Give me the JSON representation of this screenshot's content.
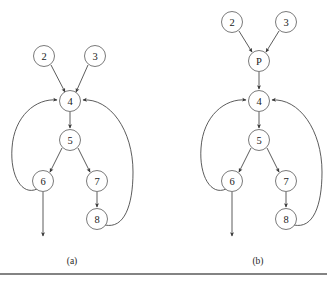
{
  "figure": {
    "type": "flow-graph-pair",
    "background_color": "#ffffff",
    "node_stroke_color": "#6b6b6b",
    "edge_color": "#4a4a4a",
    "text_color": "#1a1a1a",
    "footer_rule_color": "#5a5a5a",
    "node_radius": 10.5,
    "panels": [
      {
        "id": "panel-a",
        "caption": "(a)",
        "caption_pos": {
          "x": 72,
          "y": 264
        },
        "nodes": [
          {
            "id": "n2",
            "label": "2",
            "x": 44,
            "y": 56
          },
          {
            "id": "n3",
            "label": "3",
            "x": 95,
            "y": 56
          },
          {
            "id": "n4",
            "label": "4",
            "x": 70,
            "y": 101
          },
          {
            "id": "n5",
            "label": "5",
            "x": 70,
            "y": 140
          },
          {
            "id": "n6",
            "label": "6",
            "x": 43,
            "y": 181
          },
          {
            "id": "n7",
            "label": "7",
            "x": 97,
            "y": 181
          },
          {
            "id": "n8",
            "label": "8",
            "x": 97,
            "y": 219
          }
        ],
        "edges": [
          {
            "from": "n2",
            "to": "n4",
            "path": "M 51 65 L 65 92",
            "arrow": true
          },
          {
            "from": "n3",
            "to": "n4",
            "path": "M 88 65 L 76 92",
            "arrow": true
          },
          {
            "from": "n4",
            "to": "n5",
            "path": "M 70 112 L 70 128",
            "arrow": true
          },
          {
            "from": "n5",
            "to": "n6",
            "path": "M 62 148 L 50 172",
            "arrow": true
          },
          {
            "from": "n5",
            "to": "n7",
            "path": "M 78 148 L 90 172",
            "arrow": true
          },
          {
            "from": "n7",
            "to": "n8",
            "path": "M 97 192 L 97 207",
            "arrow": true
          },
          {
            "from": "n6",
            "to": "n4",
            "path": "M 37 189 C 22 196 10 176 12 148 C 14 116 36 98 57 100",
            "arrow": true,
            "kind": "back-edge-left"
          },
          {
            "from": "n8",
            "to": "n4",
            "path": "M 105 225 C 124 229 133 206 133 172 C 133 130 110 98 83 100",
            "arrow": true,
            "kind": "back-edge-right"
          },
          {
            "from": "n6",
            "to": "exit-a",
            "path": "M 43 192 L 43 236",
            "arrow": true,
            "kind": "exit"
          }
        ]
      },
      {
        "id": "panel-b",
        "caption": "(b)",
        "caption_pos": {
          "x": 258,
          "y": 264
        },
        "nodes": [
          {
            "id": "n2",
            "label": "2",
            "x": 232,
            "y": 22
          },
          {
            "id": "n3",
            "label": "3",
            "x": 286,
            "y": 22
          },
          {
            "id": "nP",
            "label": "P",
            "x": 259,
            "y": 61
          },
          {
            "id": "n4",
            "label": "4",
            "x": 259,
            "y": 101
          },
          {
            "id": "n5",
            "label": "5",
            "x": 259,
            "y": 140
          },
          {
            "id": "n6",
            "label": "6",
            "x": 232,
            "y": 181
          },
          {
            "id": "n7",
            "label": "7",
            "x": 286,
            "y": 181
          },
          {
            "id": "n8",
            "label": "8",
            "x": 286,
            "y": 219
          }
        ],
        "edges": [
          {
            "from": "n2",
            "to": "nP",
            "path": "M 239 31 L 252 52",
            "arrow": true
          },
          {
            "from": "n3",
            "to": "nP",
            "path": "M 279 31 L 266 52",
            "arrow": true
          },
          {
            "from": "nP",
            "to": "n4",
            "path": "M 259 72 L 259 89",
            "arrow": true
          },
          {
            "from": "n4",
            "to": "n5",
            "path": "M 259 112 L 259 128",
            "arrow": true
          },
          {
            "from": "n5",
            "to": "n6",
            "path": "M 251 148 L 239 172",
            "arrow": true
          },
          {
            "from": "n5",
            "to": "n7",
            "path": "M 267 148 L 279 172",
            "arrow": true
          },
          {
            "from": "n7",
            "to": "n8",
            "path": "M 286 192 L 286 207",
            "arrow": true
          },
          {
            "from": "n6",
            "to": "n4",
            "path": "M 226 189 C 211 196 199 176 201 148 C 203 116 225 98 246 100",
            "arrow": true,
            "kind": "back-edge-left"
          },
          {
            "from": "n8",
            "to": "n4",
            "path": "M 294 225 C 313 229 322 206 322 172 C 322 130 299 98 272 100",
            "arrow": true,
            "kind": "back-edge-right"
          },
          {
            "from": "n6",
            "to": "exit-b",
            "path": "M 232 192 L 232 236",
            "arrow": true,
            "kind": "exit"
          }
        ]
      }
    ],
    "footer_rule": {
      "x1": 0,
      "y1": 274,
      "x2": 327,
      "y2": 274
    }
  }
}
